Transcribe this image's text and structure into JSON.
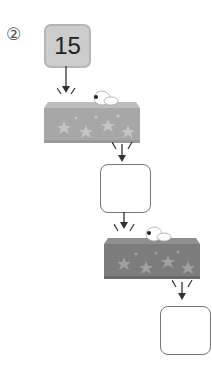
{
  "problem": {
    "label": "②",
    "start_value": "15",
    "steps": [
      {
        "type": "machine",
        "shade": "light",
        "color": "#a7a7a7"
      },
      {
        "type": "answer-box",
        "value": ""
      },
      {
        "type": "machine",
        "shade": "dark",
        "color": "#7c7c7c"
      },
      {
        "type": "answer-box",
        "value": ""
      }
    ]
  }
}
